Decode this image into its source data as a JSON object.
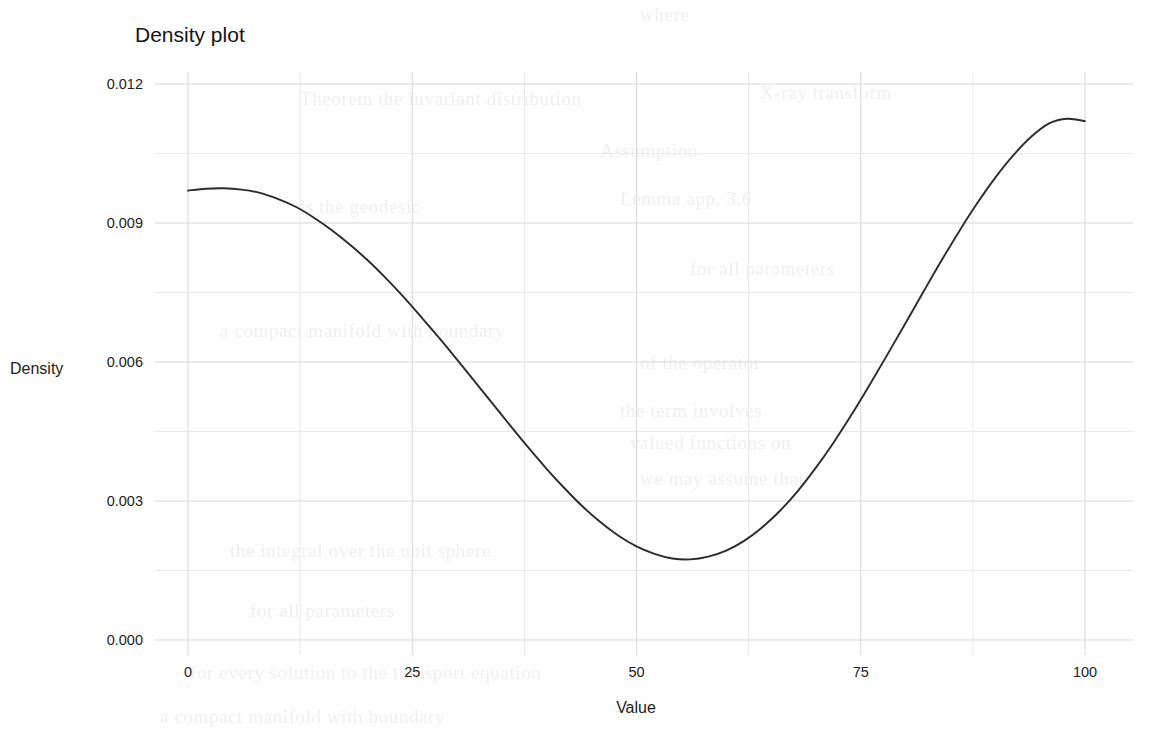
{
  "chart_data": {
    "type": "line",
    "title": "Density plot",
    "xlabel": "Value",
    "ylabel": "Density",
    "xlim": [
      0,
      100
    ],
    "ylim": [
      0.0,
      0.012
    ],
    "grid": true,
    "legend": "none",
    "x_ticks": [
      "0",
      "25",
      "50",
      "75",
      "100"
    ],
    "x_tick_values": [
      0,
      25,
      50,
      75,
      100
    ],
    "y_ticks": [
      "0.000",
      "0.003",
      "0.006",
      "0.009",
      "0.012"
    ],
    "y_tick_values": [
      0.0,
      0.003,
      0.006,
      0.009,
      0.012
    ],
    "series": [
      {
        "name": "density",
        "x": [
          0,
          2,
          4,
          6,
          8,
          10,
          12,
          14,
          16,
          18,
          20,
          22,
          24,
          26,
          28,
          30,
          32,
          34,
          36,
          38,
          40,
          42,
          44,
          46,
          48,
          50,
          52,
          54,
          56,
          58,
          60,
          62,
          64,
          66,
          68,
          70,
          72,
          74,
          76,
          78,
          80,
          82,
          84,
          86,
          88,
          90,
          92,
          94,
          96,
          98,
          100
        ],
        "values": [
          0.0097,
          0.00974,
          0.00975,
          0.00972,
          0.00965,
          0.00952,
          0.00935,
          0.00912,
          0.00885,
          0.00854,
          0.0082,
          0.00782,
          0.00741,
          0.00697,
          0.00652,
          0.00605,
          0.00557,
          0.00509,
          0.00461,
          0.00414,
          0.00369,
          0.00327,
          0.00288,
          0.00254,
          0.00225,
          0.00202,
          0.00186,
          0.00176,
          0.00174,
          0.0018,
          0.00193,
          0.00214,
          0.00243,
          0.00279,
          0.00322,
          0.00372,
          0.00427,
          0.00487,
          0.00551,
          0.00617,
          0.00684,
          0.00752,
          0.00819,
          0.00883,
          0.00943,
          0.00998,
          0.01046,
          0.01086,
          0.01115,
          0.01125,
          0.0112
        ]
      }
    ]
  },
  "background_text": {
    "lines": [
      "where",
      "X-ray transform",
      "Assumption",
      "is the geodesic",
      "for all parameters",
      "of the operator",
      "the term involves",
      "Lemma  app. 3.6",
      "valued functions on",
      "Theorem  the invariant distribution",
      "a compact manifold with boundary",
      "we may assume that",
      "the integral over the unit sphere",
      "for every solution to the transport equation"
    ]
  }
}
